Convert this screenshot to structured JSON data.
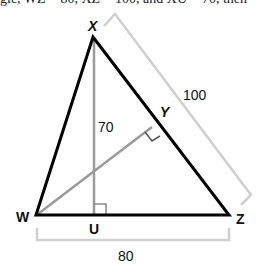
{
  "header": {
    "clipped_text": "gle, WZ = 80, XZ = 100, and XU = 70, then"
  },
  "diagram": {
    "vertices": {
      "X": {
        "label": "X",
        "x": 93,
        "y": 38
      },
      "W": {
        "label": "W",
        "x": 36,
        "y": 215
      },
      "Z": {
        "label": "Z",
        "x": 229,
        "y": 215
      },
      "U": {
        "label": "U",
        "x": 94,
        "y": 215
      },
      "Y": {
        "label": "Y",
        "x": 152,
        "y": 127
      }
    },
    "labels": {
      "x": "X",
      "w": "W",
      "z": "Z",
      "u": "U",
      "y": "Y"
    },
    "measurements": {
      "xu": "70",
      "xz": "100",
      "wz": "80"
    },
    "colors": {
      "triangle": "#000000",
      "altitude": "#999999",
      "bracket": "#cccccc",
      "text": "#111111"
    }
  }
}
